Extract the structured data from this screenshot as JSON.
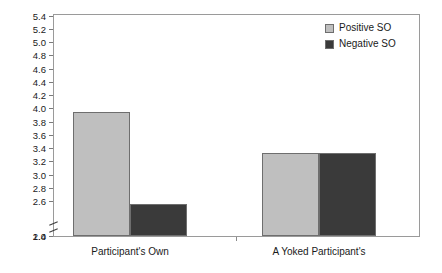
{
  "chart_data": {
    "type": "bar",
    "title": "",
    "xlabel": "",
    "ylabel": "",
    "categories": [
      "Participant's Own",
      "A Yoked Participant's"
    ],
    "series": [
      {
        "name": "Positive SO",
        "color": "#bfbfbf",
        "values": [
          3.96,
          3.34
        ]
      },
      {
        "name": "Negative SO",
        "color": "#3a3a3a",
        "values": [
          2.57,
          3.33
        ]
      }
    ],
    "ylim": [
      1.0,
      5.4
    ],
    "y_axis_break": {
      "from": 1.0,
      "to": 2.4
    },
    "y_ticks": [
      "5.4",
      "5.2",
      "5.0",
      "4.8",
      "4.6",
      "4.4",
      "4.2",
      "4.0",
      "3.8",
      "3.6",
      "3.4",
      "3.2",
      "3.0",
      "2.8",
      "2.6",
      "2.4",
      "1.0"
    ],
    "grid": false,
    "legend_position": "top-right",
    "frame": true
  },
  "y_axis": {
    "ticks": [
      {
        "label": "5.4",
        "value": 5.4
      },
      {
        "label": "5.2",
        "value": 5.2
      },
      {
        "label": "5.0",
        "value": 5.0
      },
      {
        "label": "4.8",
        "value": 4.8
      },
      {
        "label": "4.6",
        "value": 4.6
      },
      {
        "label": "4.4",
        "value": 4.4
      },
      {
        "label": "4.2",
        "value": 4.2
      },
      {
        "label": "4.0",
        "value": 4.0
      },
      {
        "label": "3.8",
        "value": 3.8
      },
      {
        "label": "3.6",
        "value": 3.6
      },
      {
        "label": "3.4",
        "value": 3.4
      },
      {
        "label": "3.2",
        "value": 3.2
      },
      {
        "label": "3.0",
        "value": 3.0
      },
      {
        "label": "2.8",
        "value": 2.8
      },
      {
        "label": "2.6",
        "value": 2.6
      },
      {
        "label": "2.4",
        "value": 2.4
      },
      {
        "label": "1.0",
        "value": 1.0
      }
    ]
  },
  "x_axis": {
    "groups": [
      {
        "label": "Participant's Own"
      },
      {
        "label": "A Yoked Participant's"
      }
    ]
  },
  "legend": {
    "entries": [
      {
        "label": "Positive SO",
        "color": "#bfbfbf",
        "swatch_icon": "legend-swatch-icon"
      },
      {
        "label": "Negative SO",
        "color": "#3a3a3a",
        "swatch_icon": "legend-swatch-icon"
      }
    ]
  },
  "colors": {
    "positive_so": "#bfbfbf",
    "negative_so": "#3a3a3a",
    "frame": "#9a9a9a",
    "bar_outline": "#6e6e6e",
    "text": "#1a1a1a",
    "background": "#ffffff"
  }
}
